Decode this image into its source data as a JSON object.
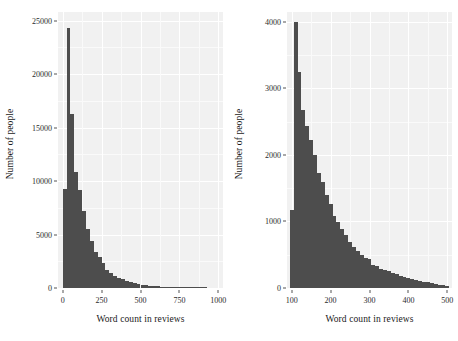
{
  "figure": {
    "background": "#ffffff",
    "panel_background": "#f1f1f1",
    "bar_color": "#4d4d4d",
    "grid_color": "#ffffff"
  },
  "chart_data": [
    {
      "id": "left",
      "type": "bar",
      "subtype": "histogram",
      "title": "",
      "xlabel": "Word count in reviews",
      "ylabel": "Number of people",
      "xlim": [
        -30,
        1030
      ],
      "ylim": [
        0,
        25800
      ],
      "xticks": [
        0,
        250,
        500,
        750,
        1000
      ],
      "xtick_labels": [
        "0",
        "250",
        "500",
        "750",
        "1000"
      ],
      "yticks": [
        0,
        5000,
        10000,
        15000,
        20000,
        25000
      ],
      "ytick_labels": [
        "0",
        "5000",
        "10000",
        "15000",
        "20000",
        "25000"
      ],
      "grid": true,
      "legend": "none",
      "bin_width": 25,
      "bin_starts": [
        0,
        25,
        50,
        75,
        100,
        125,
        150,
        175,
        200,
        225,
        250,
        275,
        300,
        325,
        350,
        375,
        400,
        425,
        450,
        475,
        500,
        525,
        550,
        575,
        600,
        625,
        650,
        675,
        700,
        725,
        750,
        775,
        800,
        825,
        850,
        875,
        900
      ],
      "values": [
        9300,
        24300,
        16300,
        10800,
        9150,
        7200,
        5500,
        4400,
        3400,
        2900,
        2350,
        1700,
        1450,
        1150,
        950,
        800,
        650,
        540,
        450,
        380,
        320,
        270,
        230,
        195,
        160,
        135,
        115,
        95,
        80,
        68,
        55,
        45,
        36,
        28,
        20,
        14,
        8
      ]
    },
    {
      "id": "right",
      "type": "bar",
      "subtype": "histogram",
      "title": "",
      "xlabel": "Word count in reviews",
      "ylabel": "Number of people",
      "xlim": [
        88,
        512
      ],
      "ylim": [
        0,
        4150
      ],
      "xticks": [
        100,
        200,
        300,
        400,
        500
      ],
      "xtick_labels": [
        "100",
        "200",
        "300",
        "400",
        "500"
      ],
      "yticks": [
        0,
        1000,
        2000,
        3000,
        4000
      ],
      "ytick_labels": [
        "0",
        "1000",
        "2000",
        "3000",
        "4000"
      ],
      "grid": true,
      "legend": "none",
      "bin_width": 10,
      "bin_starts": [
        95,
        105,
        115,
        125,
        135,
        145,
        155,
        165,
        175,
        185,
        195,
        205,
        215,
        225,
        235,
        245,
        255,
        265,
        275,
        285,
        295,
        305,
        315,
        325,
        335,
        345,
        355,
        365,
        375,
        385,
        395,
        405,
        415,
        425,
        435,
        445,
        455,
        465,
        475,
        485,
        495
      ],
      "values": [
        1180,
        4000,
        3250,
        2670,
        2430,
        2230,
        2000,
        1730,
        1600,
        1400,
        1270,
        1090,
        1000,
        880,
        790,
        690,
        620,
        560,
        500,
        450,
        430,
        350,
        330,
        290,
        270,
        250,
        225,
        205,
        185,
        165,
        150,
        135,
        120,
        105,
        95,
        85,
        70,
        60,
        50,
        40,
        30
      ]
    }
  ]
}
